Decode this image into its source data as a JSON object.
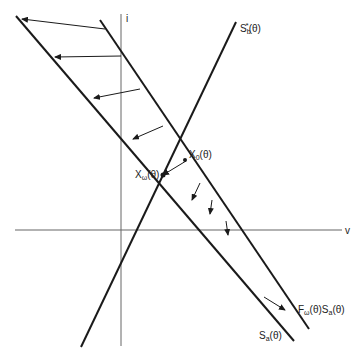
{
  "diagram": {
    "type": "phase-plane construction",
    "axes": {
      "vertical_label": "i",
      "horizontal_label": "v"
    },
    "lines": {
      "sb_star": {
        "label_main": "S",
        "label_sub": "b",
        "label_sup": "*",
        "label_arg": "(θ)"
      },
      "sa": {
        "label_main": "S",
        "label_sub": "a",
        "label_arg": "(θ)"
      },
      "f_omega_sa": {
        "label_f": "F",
        "label_f_sub": "ω",
        "label_mid": "(θ)S",
        "label_sub": "a",
        "label_arg": "(θ)"
      }
    },
    "points": {
      "x0": {
        "label_main": "X",
        "label_sub": "0",
        "label_arg": "(θ)"
      },
      "x_omega": {
        "label_main": "X",
        "label_sub": "ω",
        "label_arg": "(θ)"
      }
    },
    "colors": {
      "ink": "#1a1a1a",
      "axis": "#555555",
      "background": "#ffffff"
    }
  }
}
